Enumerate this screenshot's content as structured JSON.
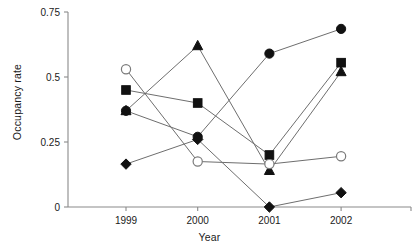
{
  "chart_data": {
    "type": "line",
    "title": "",
    "subtitle": "",
    "xlabel": "Year",
    "ylabel": "Occupancy rate",
    "categories": [
      "1999",
      "2000",
      "2001",
      "2002"
    ],
    "x": [
      1999,
      2000,
      2001,
      2002
    ],
    "xlim": [
      1998.6,
      2002.9
    ],
    "ylim": [
      0,
      0.75
    ],
    "yticks": [
      0,
      0.25,
      0.5,
      0.75
    ],
    "ytick_labels": [
      "0",
      "0.25",
      "0.5",
      "0.75"
    ],
    "xtick_labels": [
      "1999",
      "2000",
      "2001",
      "2002"
    ],
    "grid": false,
    "legend": "none",
    "line_color": "#6e6e6e",
    "marker_color": "#111111",
    "axis_color": "#8a8a8a",
    "series": [
      {
        "name": "filled-circle",
        "marker": "circle-filled",
        "values": [
          0.37,
          0.27,
          0.59,
          0.685
        ]
      },
      {
        "name": "filled-square",
        "marker": "square-filled",
        "values": [
          0.45,
          0.4,
          0.2,
          0.555
        ]
      },
      {
        "name": "filled-triangle",
        "marker": "triangle-filled",
        "values": [
          0.37,
          0.62,
          0.14,
          0.52
        ]
      },
      {
        "name": "open-circle",
        "marker": "circle-open",
        "values": [
          0.53,
          0.175,
          0.165,
          0.195
        ]
      },
      {
        "name": "filled-diamond",
        "marker": "diamond-filled",
        "values": [
          0.165,
          0.26,
          0.0,
          0.055
        ]
      }
    ]
  }
}
